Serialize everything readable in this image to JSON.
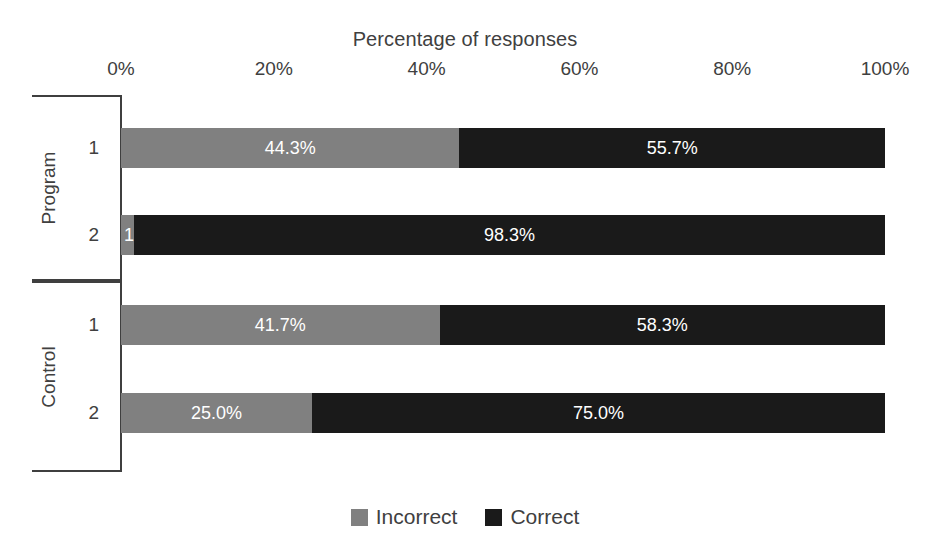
{
  "chart_data": {
    "type": "bar",
    "subtype": "100% stacked horizontal bar",
    "title": "Percentage of responses",
    "xlabel": "Percentage of responses",
    "ylabel": "",
    "xlim": [
      0,
      100
    ],
    "xticks": [
      "0%",
      "20%",
      "40%",
      "60%",
      "80%",
      "100%"
    ],
    "xtick_values": [
      0,
      20,
      40,
      60,
      80,
      100
    ],
    "grid": false,
    "legend_position": "bottom",
    "legend": [
      "Incorrect",
      "Correct"
    ],
    "colors": {
      "Incorrect": "#808080",
      "Correct": "#1a1a1a"
    },
    "groups": [
      {
        "name": "Program",
        "categories": [
          "1",
          "2"
        ]
      },
      {
        "name": "Control",
        "categories": [
          "1",
          "2"
        ]
      }
    ],
    "categories": [
      "Program 1",
      "Program 2",
      "Control 1",
      "Control 2"
    ],
    "series": [
      {
        "name": "Incorrect",
        "values": [
          44.3,
          1.7,
          41.7,
          25.0
        ]
      },
      {
        "name": "Correct",
        "values": [
          55.7,
          98.3,
          58.3,
          75.0
        ]
      }
    ],
    "bars": [
      {
        "group": "Program",
        "category": "1",
        "segments": [
          {
            "series": "Incorrect",
            "value": 44.3,
            "label": "44.3%"
          },
          {
            "series": "Correct",
            "value": 55.7,
            "label": "55.7%"
          }
        ]
      },
      {
        "group": "Program",
        "category": "2",
        "segments": [
          {
            "series": "Incorrect",
            "value": 1.7,
            "label": "1.7%"
          },
          {
            "series": "Correct",
            "value": 98.3,
            "label": "98.3%"
          }
        ]
      },
      {
        "group": "Control",
        "category": "1",
        "segments": [
          {
            "series": "Incorrect",
            "value": 41.7,
            "label": "41.7%"
          },
          {
            "series": "Correct",
            "value": 58.3,
            "label": "58.3%"
          }
        ]
      },
      {
        "group": "Control",
        "category": "2",
        "segments": [
          {
            "series": "Incorrect",
            "value": 25.0,
            "label": "25.0%"
          },
          {
            "series": "Correct",
            "value": 75.0,
            "label": "75.0%"
          }
        ]
      }
    ]
  }
}
